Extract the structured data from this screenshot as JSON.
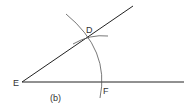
{
  "diagram": {
    "type": "geometric-construction",
    "caption": "(b)",
    "points": {
      "E": {
        "label": "E",
        "x": 22,
        "y": 82
      },
      "D": {
        "label": "D",
        "x": 88,
        "y": 37
      },
      "F": {
        "label": "F",
        "x": 101,
        "y": 82
      }
    },
    "rays": [
      {
        "name": "ray-ED",
        "from": "E",
        "through": "D",
        "end": [
          133,
          6
        ]
      },
      {
        "name": "ray-EF",
        "from": "E",
        "through": "F",
        "end": [
          184,
          82
        ]
      }
    ],
    "arcs": [
      {
        "name": "arc-centered-E",
        "description": "large arc through D and F"
      },
      {
        "name": "arc-small-at-D",
        "description": "short intersecting arc marking D"
      }
    ],
    "colors": {
      "line": "#222222",
      "arc": "#555555",
      "label": "#333333"
    }
  }
}
